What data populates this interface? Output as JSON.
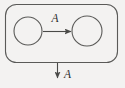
{
  "diagram": {
    "type": "state-transition-diagram",
    "background_color": "#f3f2f1",
    "stroke_color": "#555553",
    "label_color": "#2b2b2b",
    "container": {
      "name": "outer-rounded-box",
      "label": "",
      "x": 5,
      "y": 4,
      "width": 113,
      "height": 59,
      "corner_radius": 11,
      "fill": "#f3f2f1"
    },
    "nodes": [
      {
        "id": "node-left",
        "label": "",
        "shape": "circle",
        "cx": 28,
        "cy": 31,
        "r": 14,
        "fill": "none"
      },
      {
        "id": "node-right",
        "label": "",
        "shape": "circle",
        "cx": 87,
        "cy": 31,
        "r": 15,
        "fill": "none"
      }
    ],
    "edges": [
      {
        "id": "edge-horizontal",
        "label": "A",
        "from": "node-left",
        "to": "node-right",
        "direction": "right",
        "x1": 43,
        "y1": 31,
        "x2": 72,
        "y2": 31,
        "label_x": 55,
        "label_y": 21,
        "label_font_size": 11
      },
      {
        "id": "edge-outgoing",
        "label": "A",
        "from": "outer-rounded-box",
        "to": "",
        "direction": "down",
        "x1": 57,
        "y1": 63,
        "x2": 57,
        "y2": 79,
        "label_x": 64,
        "label_y": 77,
        "label_font_size": 11
      }
    ],
    "arrowhead": {
      "name": "triangle-arrowhead",
      "width": 6,
      "length": 7
    }
  }
}
